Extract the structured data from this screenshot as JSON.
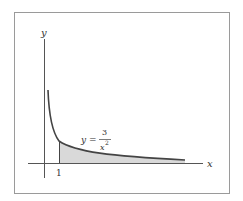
{
  "figure": {
    "x_axis_label": "x",
    "y_axis_label": "y",
    "tick_label": "1",
    "equation": {
      "lhs": "y =",
      "numerator": "3",
      "denominator": "x",
      "exponent": "2"
    },
    "colors": {
      "frame": "#9a9a9a",
      "axes": "#555555",
      "curve": "#444444",
      "shaded_region": "#d9d9d9"
    }
  }
}
